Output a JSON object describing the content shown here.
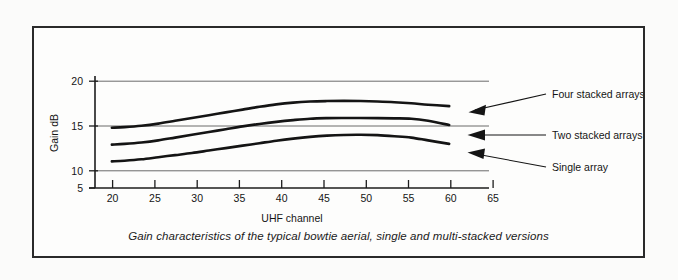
{
  "figure": {
    "caption": "Gain characteristics of the typical bowtie aerial, single and multi-stacked versions"
  },
  "chart_data": {
    "type": "line",
    "title": "",
    "xlabel": "UHF channel",
    "ylabel": "Gain dB",
    "xlim": [
      18.5,
      67
    ],
    "ylim": [
      5,
      21
    ],
    "xticks": [
      20,
      25,
      30,
      35,
      40,
      45,
      50,
      55,
      60,
      65
    ],
    "yticks": [
      5,
      10,
      15,
      20
    ],
    "gridlines": [
      10,
      15,
      20
    ],
    "grid": "horizontal-only",
    "legend_position": "inline-annotations-right",
    "x": [
      20.5,
      22,
      24,
      26,
      28,
      30,
      32,
      34,
      36,
      38,
      40,
      42,
      44,
      46,
      48,
      50,
      52,
      54,
      56,
      58,
      60.5
    ],
    "series": [
      {
        "name": "Four stacked arrays",
        "values": [
          13.6,
          13.7,
          13.9,
          14.2,
          14.6,
          15.0,
          15.4,
          15.8,
          16.2,
          16.6,
          16.95,
          17.2,
          17.35,
          17.42,
          17.45,
          17.42,
          17.35,
          17.25,
          17.1,
          16.9,
          16.7
        ],
        "annotation": "Four stacked arrays",
        "end_value": 16.7,
        "start_value": 13.6,
        "peak_value": 17.45
      },
      {
        "name": "Two stacked arrays",
        "values": [
          11.2,
          11.3,
          11.5,
          11.8,
          12.2,
          12.6,
          13.0,
          13.4,
          13.8,
          14.15,
          14.45,
          14.7,
          14.9,
          14.98,
          15.0,
          15.0,
          14.98,
          14.95,
          14.9,
          14.6,
          14.0
        ],
        "annotation": "Two stacked arrays",
        "end_value": 14.0,
        "start_value": 11.2,
        "peak_value": 15.0
      },
      {
        "name": "Single array",
        "values": [
          8.8,
          8.9,
          9.1,
          9.4,
          9.7,
          10.0,
          10.35,
          10.7,
          11.05,
          11.4,
          11.75,
          12.05,
          12.3,
          12.48,
          12.58,
          12.6,
          12.55,
          12.4,
          12.2,
          11.8,
          11.3
        ],
        "annotation": "Single array",
        "end_value": 11.3,
        "start_value": 8.8,
        "peak_value": 12.6
      }
    ],
    "annotations": [
      {
        "label": "Four stacked arrays"
      },
      {
        "label": "Two stacked arrays"
      },
      {
        "label": "Single array"
      }
    ],
    "tick_labels_x": [
      "20",
      "25",
      "30",
      "35",
      "40",
      "45",
      "50",
      "55",
      "60",
      "65"
    ],
    "tick_labels_y": [
      "5",
      "10",
      "15",
      "20"
    ]
  }
}
